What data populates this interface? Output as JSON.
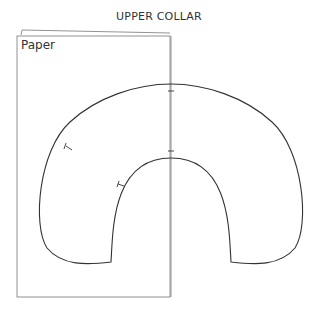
{
  "title": "UPPER COLLAR",
  "paper": {
    "label": "Paper"
  },
  "colors": {
    "outline": "#333333",
    "paper_edge": "#777777"
  }
}
